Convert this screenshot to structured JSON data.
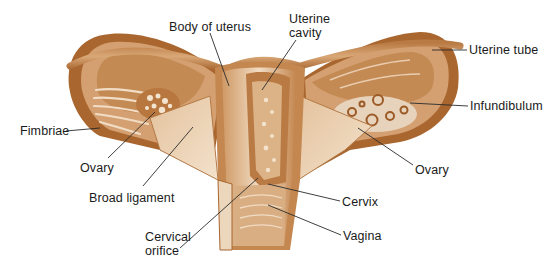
{
  "colors": {
    "tissue_dark": "#9c5a26",
    "tissue_mid": "#c68a55",
    "tissue_light": "#e8cbab",
    "highlight": "#f6ebdd",
    "leader": "#2a2a2a",
    "text": "#1a1a1a"
  },
  "labels": [
    {
      "id": "body-of-uterus",
      "text": "Body of uterus",
      "x": 169,
      "y": 20
    },
    {
      "id": "uterine-cavity-1",
      "text": "Uterine",
      "x": 289,
      "y": 12
    },
    {
      "id": "uterine-cavity-2",
      "text": "cavity",
      "x": 289,
      "y": 26
    },
    {
      "id": "uterine-tube",
      "text": "Uterine tube",
      "x": 469,
      "y": 43
    },
    {
      "id": "infundibulum",
      "text": "Infundibulum",
      "x": 470,
      "y": 99
    },
    {
      "id": "fimbriae",
      "text": "Fimbriae",
      "x": 20,
      "y": 126
    },
    {
      "id": "ovary-left",
      "text": "Ovary",
      "x": 80,
      "y": 161
    },
    {
      "id": "ovary-right",
      "text": "Ovary",
      "x": 415,
      "y": 163
    },
    {
      "id": "broad-ligament",
      "text": "Broad ligament",
      "x": 89,
      "y": 191
    },
    {
      "id": "cervix",
      "text": "Cervix",
      "x": 342,
      "y": 195
    },
    {
      "id": "cervical-orifice-1",
      "text": "Cervical",
      "x": 145,
      "y": 230
    },
    {
      "id": "cervical-orifice-2",
      "text": "orifice",
      "x": 145,
      "y": 244
    },
    {
      "id": "vagina",
      "text": "Vagina",
      "x": 343,
      "y": 229
    }
  ],
  "leaders": [
    {
      "for": "body-of-uterus",
      "from": [
        210,
        33
      ],
      "to": [
        229,
        86
      ]
    },
    {
      "for": "uterine-cavity",
      "from": [
        296,
        40
      ],
      "to": [
        262,
        90
      ]
    },
    {
      "for": "uterine-tube",
      "from": [
        467,
        50
      ],
      "to": [
        432,
        50
      ]
    },
    {
      "for": "infundibulum",
      "from": [
        468,
        106
      ],
      "to": [
        410,
        103
      ]
    },
    {
      "for": "fimbriae",
      "from": [
        66,
        131
      ],
      "to": [
        100,
        128
      ]
    },
    {
      "for": "ovary-left",
      "from": [
        108,
        158
      ],
      "to": [
        155,
        112
      ]
    },
    {
      "for": "ovary-right",
      "from": [
        413,
        165
      ],
      "to": [
        358,
        128
      ]
    },
    {
      "for": "broad-ligament",
      "from": [
        143,
        186
      ],
      "to": [
        193,
        127
      ]
    },
    {
      "for": "cervix",
      "from": [
        340,
        201
      ],
      "to": [
        268,
        184
      ]
    },
    {
      "for": "cervical-orifice",
      "from": [
        180,
        248
      ],
      "to": [
        258,
        178
      ]
    },
    {
      "for": "vagina",
      "from": [
        341,
        235
      ],
      "to": [
        268,
        205
      ]
    }
  ]
}
